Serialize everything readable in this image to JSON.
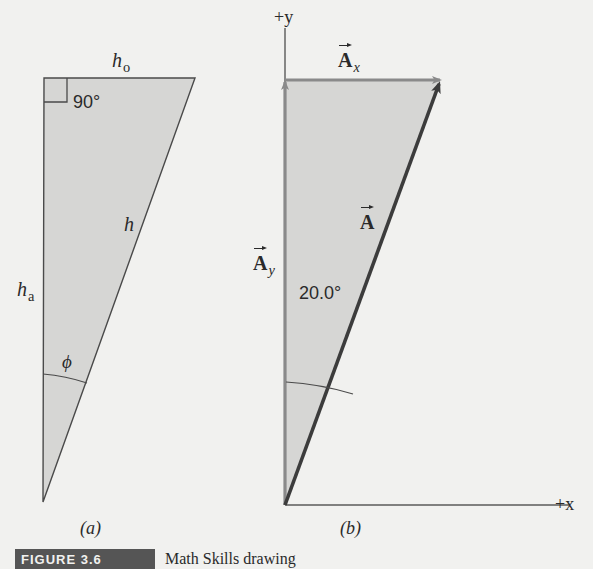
{
  "colors": {
    "background": "#f1f1ef",
    "triangle_fill": "#d6d6d4",
    "triangle_stroke": "#4a4a4a",
    "component_vector": "#8a8a8a",
    "resultant_vector": "#3c3c3c",
    "axis": "#5a5a5a",
    "caption_box": "#555555",
    "text": "#2a2a2a"
  },
  "panel_a": {
    "caption": "(a)",
    "right_angle_label": "90°",
    "opposite_side": {
      "symbol": "h",
      "subscript": "o"
    },
    "adjacent_side": {
      "symbol": "h",
      "subscript": "a"
    },
    "hypotenuse": {
      "symbol": "h"
    },
    "angle_label": "ϕ",
    "vertices": {
      "top_left": [
        44,
        78
      ],
      "top_right": [
        195,
        78
      ],
      "bottom": [
        43,
        502
      ]
    }
  },
  "panel_b": {
    "caption": "(b)",
    "y_axis_label": "+y",
    "x_axis_label": "+x",
    "vector_x": {
      "symbol": "A",
      "subscript": "x"
    },
    "vector_y": {
      "symbol": "A",
      "subscript": "y"
    },
    "vector_resultant": {
      "symbol": "A"
    },
    "angle_label": "20.0°",
    "origin": [
      285,
      505
    ],
    "y_axis_top": [
      285,
      28
    ],
    "x_axis_end": [
      570,
      505
    ],
    "ay_tip": [
      285,
      80
    ],
    "ax_tip": [
      442,
      80
    ],
    "a_tip": [
      440,
      82
    ]
  },
  "caption": {
    "label": "FIGURE 3.6",
    "text": "Math Skills drawing"
  }
}
